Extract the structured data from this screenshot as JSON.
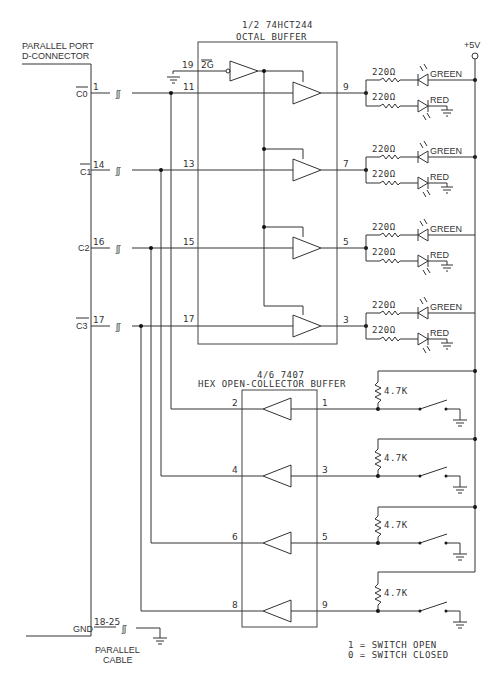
{
  "connector": {
    "title_line1": "PARALLEL PORT",
    "title_line2": "D-CONNECTOR",
    "cable_line1": "PARALLEL",
    "cable_line2": "CABLE",
    "gnd_label": "GND",
    "gnd_pins": "18-25",
    "signals": [
      {
        "name": "C0",
        "inverted": true,
        "pin": "1"
      },
      {
        "name": "C1",
        "inverted": true,
        "pin": "14"
      },
      {
        "name": "C2",
        "inverted": false,
        "pin": "16"
      },
      {
        "name": "C3",
        "inverted": true,
        "pin": "17"
      }
    ]
  },
  "octal_buffer": {
    "title_line1": "1/2 74HCT244",
    "title_line2": "OCTAL BUFFER",
    "enable_pin": "19",
    "enable_label": "2G",
    "inputs": [
      "11",
      "13",
      "15",
      "17"
    ],
    "outputs": [
      "9",
      "7",
      "5",
      "3"
    ]
  },
  "hex_buffer": {
    "title_line1": "4/6 7407",
    "title_line2": "HEX OPEN-COLLECTOR BUFFER",
    "outputs": [
      "2",
      "4",
      "6",
      "8"
    ],
    "inputs": [
      "1",
      "3",
      "5",
      "9"
    ]
  },
  "leds": {
    "resistor_value": "220Ω",
    "green_label": "GREEN",
    "red_label": "RED"
  },
  "switches": {
    "pullup_value": "4.7K"
  },
  "supply": {
    "label": "+5V"
  },
  "legend": {
    "line1": "1 = SWITCH OPEN",
    "line2": "0 = SWITCH CLOSED"
  }
}
